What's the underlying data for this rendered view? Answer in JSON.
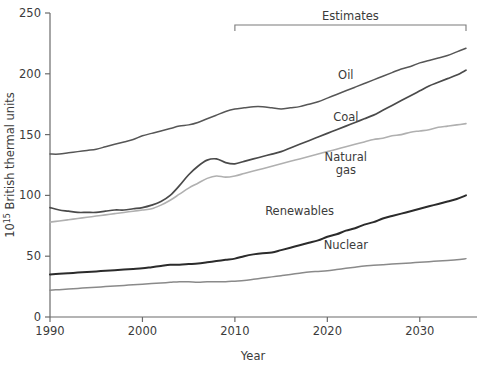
{
  "chart_data": {
    "type": "line",
    "title": "",
    "xlabel": "Year",
    "ylabel": "10^15 British thermal units",
    "ylabel_base": "10",
    "ylabel_exp": "15",
    "ylabel_rest": " British thermal units",
    "xlim": [
      1990,
      2035
    ],
    "ylim": [
      0,
      250
    ],
    "grid": false,
    "legend_position": "inline-labels",
    "x_ticks": [
      1990,
      2000,
      2010,
      2020,
      2030
    ],
    "x_tick_labels": [
      "1990",
      "2000",
      "2010",
      "2020",
      "2030"
    ],
    "y_ticks": [
      0,
      50,
      100,
      150,
      200,
      250
    ],
    "y_tick_labels": [
      "0",
      "50",
      "100",
      "150",
      "200",
      "250"
    ],
    "annotations": [
      {
        "text": "Estimates",
        "type": "bracket",
        "x_start": 2010,
        "x_end": 2035,
        "y": 250
      }
    ],
    "x": [
      1990,
      1991,
      1992,
      1993,
      1994,
      1995,
      1996,
      1997,
      1998,
      1999,
      2000,
      2001,
      2002,
      2003,
      2004,
      2005,
      2006,
      2007,
      2008,
      2009,
      2010,
      2011,
      2012,
      2013,
      2014,
      2015,
      2016,
      2017,
      2018,
      2019,
      2020,
      2021,
      2022,
      2023,
      2024,
      2025,
      2026,
      2027,
      2028,
      2029,
      2030,
      2031,
      2032,
      2033,
      2034,
      2035
    ],
    "series": [
      {
        "name": "Oil",
        "label": "Oil",
        "color": "#565656",
        "width": 1.5,
        "label_x": 2022,
        "label_y": 196,
        "values": [
          134,
          134,
          135,
          136,
          137,
          138,
          140,
          142,
          144,
          146,
          149,
          151,
          153,
          155,
          157,
          158,
          160,
          163,
          166,
          169,
          171,
          172,
          173,
          173,
          172,
          171,
          172,
          173,
          175,
          177,
          180,
          183,
          186,
          189,
          192,
          195,
          198,
          201,
          204,
          206,
          209,
          211,
          213,
          215,
          218,
          221
        ]
      },
      {
        "name": "Coal",
        "label": "Coal",
        "color": "#4a4a4a",
        "width": 1.7,
        "label_x": 2022,
        "label_y": 161,
        "values": [
          90,
          88,
          87,
          86,
          86,
          86,
          87,
          88,
          88,
          89,
          90,
          92,
          95,
          100,
          108,
          117,
          124,
          129,
          130,
          127,
          126,
          128,
          130,
          132,
          134,
          136,
          139,
          142,
          145,
          148,
          151,
          154,
          157,
          160,
          163,
          166,
          170,
          174,
          178,
          182,
          186,
          190,
          193,
          196,
          199,
          203
        ]
      },
      {
        "name": "Natural gas",
        "label": "Natural",
        "label2": "gas",
        "color": "#b0b0b0",
        "width": 1.6,
        "label_x": 2022,
        "label_y": 128,
        "values": [
          78,
          79,
          80,
          81,
          82,
          83,
          84,
          85,
          86,
          87,
          88,
          89,
          92,
          96,
          101,
          106,
          110,
          114,
          116,
          115,
          116,
          118,
          120,
          122,
          124,
          126,
          128,
          130,
          132,
          134,
          136,
          138,
          140,
          142,
          144,
          146,
          147,
          149,
          150,
          152,
          153,
          154,
          156,
          157,
          158,
          159
        ]
      },
      {
        "name": "Renewables",
        "label": "Renewables",
        "color": "#2b2b2b",
        "width": 2.0,
        "label_x": 2017,
        "label_y": 84,
        "values": [
          35,
          35.5,
          36,
          36.5,
          37,
          37.5,
          38,
          38.5,
          39,
          39.5,
          40,
          41,
          42,
          43,
          43,
          43.5,
          44,
          45,
          46,
          47,
          48,
          50,
          51.5,
          52.5,
          53,
          55,
          57,
          59,
          61,
          63,
          66,
          68,
          71,
          73,
          76,
          78,
          81,
          83,
          85,
          87,
          89,
          91,
          93,
          95,
          97,
          100
        ]
      },
      {
        "name": "Nuclear",
        "label": "Nuclear",
        "color": "#8a8a8a",
        "width": 1.5,
        "label_x": 2022,
        "label_y": 56,
        "values": [
          22,
          22.5,
          23,
          23.5,
          24,
          24.5,
          25,
          25.5,
          26,
          26.5,
          27,
          27.5,
          28,
          28.5,
          29,
          29,
          28.5,
          29,
          29,
          29,
          29.5,
          30,
          31,
          32,
          33,
          34,
          35,
          36,
          37,
          37.5,
          38,
          39,
          40,
          41,
          42,
          42.5,
          43,
          43.5,
          44,
          44.5,
          45,
          45.5,
          46,
          46.5,
          47,
          48
        ]
      }
    ]
  }
}
